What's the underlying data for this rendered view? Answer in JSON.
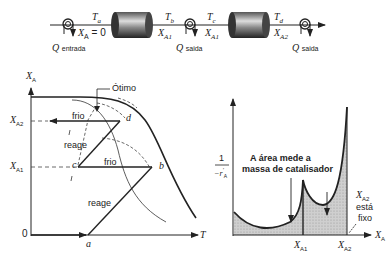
{
  "schematic": {
    "inlet_label": "Q",
    "inlet_sub": "entrada",
    "outlet1_label": "Q",
    "outlet1_sub": "saida",
    "outlet2_label": "Q",
    "outlet2_sub": "saida",
    "Ta": "T",
    "Ta_sub": "a",
    "Tb": "T",
    "Tb_sub": "b",
    "Tc": "T",
    "Tc_sub": "c",
    "Td": "T",
    "Td_sub": "d",
    "XA0": "X",
    "XA0_sub": "A",
    "XA0_val": " = 0",
    "XA1_left": "X",
    "XA1_left_sub": "A1",
    "XA1_right": "X",
    "XA1_right_sub": "A1",
    "XA2": "X",
    "XA2_sub": "A2"
  },
  "left_plot": {
    "y_axis_label": "X",
    "y_axis_sub": "A",
    "x_axis_label": "T",
    "y_tick_XA2": "X",
    "y_tick_XA2_sub": "A2",
    "y_tick_XA1": "X",
    "y_tick_XA1_sub": "A1",
    "y_tick_zero": "0",
    "optimo": "Ótimo",
    "frio_top": "frio",
    "frio_mid": "frio",
    "reage_top": "reage",
    "reage_bottom": "reage",
    "pt_a": "a",
    "pt_b": "b",
    "pt_c": "c",
    "pt_d": "d"
  },
  "right_plot": {
    "y_num": "1",
    "y_den": "−r",
    "y_den_sub": "A",
    "y_den_sup": "′",
    "x_axis_label": "X",
    "x_axis_sub": "A",
    "x_tick_1": "X",
    "x_tick_1_sub": "A1",
    "x_tick_2": "X",
    "x_tick_2_sub": "A2",
    "area_note_line1": "A área mede a",
    "area_note_line2": "massa de catalisador",
    "fixed_label": "X",
    "fixed_sub": "A2",
    "fixed_line1": "está",
    "fixed_line2": "fixo"
  }
}
